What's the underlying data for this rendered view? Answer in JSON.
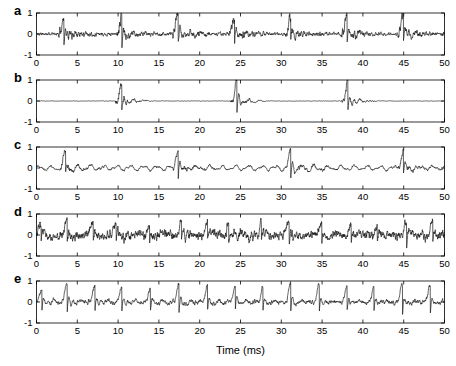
{
  "figure": {
    "background_color": "#ffffff",
    "trace_color": "#1a1a1a",
    "axis_color": "#000000",
    "xlabel": "Time (ms)",
    "panel_labels": [
      "a",
      "b",
      "c",
      "d",
      "e"
    ]
  },
  "chart_data": [
    {
      "type": "line",
      "panel": "a",
      "title": "",
      "xlabel": "",
      "ylabel": "",
      "xlim": [
        0,
        50
      ],
      "ylim": [
        -1,
        1
      ],
      "xticks": [
        0,
        5,
        10,
        15,
        20,
        25,
        30,
        35,
        40,
        45,
        50
      ],
      "xticklabels": [
        "0",
        "5",
        "10",
        "15",
        "20",
        "25",
        "30",
        "35",
        "40",
        "45",
        "50"
      ],
      "yticks": [
        -1,
        0,
        1
      ],
      "yticklabels": [
        "-1",
        "0",
        "1"
      ],
      "grid": false,
      "legend": null,
      "description": "sparse large spikes on low-amplitude noisy baseline",
      "spike_times": [
        3.2,
        10.3,
        17.2,
        24.1,
        31.0,
        37.9,
        44.8
      ],
      "spike_amplitude": 0.92,
      "noise_amplitude": 0.085,
      "baseline": 0.0,
      "seed": 11
    },
    {
      "type": "line",
      "panel": "b",
      "title": "",
      "xlabel": "",
      "ylabel": "",
      "xlim": [
        0,
        50
      ],
      "ylim": [
        -1,
        1
      ],
      "xticks": [
        0,
        5,
        10,
        15,
        20,
        25,
        30,
        35,
        40,
        45,
        50
      ],
      "xticklabels": [
        "0",
        "5",
        "10",
        "15",
        "20",
        "25",
        "30",
        "35",
        "40",
        "45",
        "50"
      ],
      "yticks": [
        -1,
        0,
        1
      ],
      "yticklabels": [
        "-1",
        "0",
        "1"
      ],
      "grid": false,
      "legend": null,
      "description": "very sparse large spikes with mostly flat baseline and short decaying ringing after each spike",
      "spike_times": [
        10.3,
        24.4,
        38.0
      ],
      "spike_amplitude": 0.98,
      "noise_amplitude": 0.022,
      "baseline": 0.0,
      "seed": 23
    },
    {
      "type": "line",
      "panel": "c",
      "title": "",
      "xlabel": "",
      "ylabel": "",
      "xlim": [
        0,
        50
      ],
      "ylim": [
        -1,
        1
      ],
      "xticks": [
        0,
        5,
        10,
        15,
        20,
        25,
        30,
        35,
        40,
        45,
        50
      ],
      "xticklabels": [
        "0",
        "5",
        "10",
        "15",
        "20",
        "25",
        "30",
        "35",
        "40",
        "45",
        "50"
      ],
      "yticks": [
        -1,
        0,
        1
      ],
      "yticklabels": [
        "-1",
        "0",
        "1"
      ],
      "grid": false,
      "legend": null,
      "description": "periodic oscillatory wave with large spikes every ~13.8 ms",
      "spike_times": [
        3.4,
        17.2,
        31.0,
        44.8
      ],
      "spike_amplitude": 0.88,
      "noise_amplitude": 0.055,
      "oscillation_amplitude": 0.09,
      "oscillation_freq_per_ms": 0.62,
      "baseline": 0.0,
      "seed": 37
    },
    {
      "type": "line",
      "panel": "d",
      "title": "",
      "xlabel": "",
      "ylabel": "",
      "xlim": [
        0,
        50
      ],
      "ylim": [
        -1,
        1
      ],
      "xticks": [
        0,
        5,
        10,
        15,
        20,
        25,
        30,
        35,
        40,
        45,
        50
      ],
      "xticklabels": [
        "0",
        "5",
        "10",
        "15",
        "20",
        "25",
        "30",
        "35",
        "40",
        "45",
        "50"
      ],
      "yticks": [
        -1,
        0,
        1
      ],
      "yticklabels": [
        "-1",
        "0",
        "1"
      ],
      "grid": false,
      "legend": null,
      "description": "dense irregular activity with many medium-amplitude fluctuations and occasional tall spikes",
      "spike_times": [
        0.4,
        3.6,
        6.8,
        9.6,
        13.7,
        17.6,
        20.8,
        23.4,
        27.4,
        30.8,
        34.8,
        38.4,
        41.6,
        45.2,
        48.4
      ],
      "spike_amplitude": 0.62,
      "noise_amplitude": 0.16,
      "baseline": 0.0,
      "seed": 53
    },
    {
      "type": "line",
      "panel": "e",
      "title": "",
      "xlabel": "",
      "ylabel": "",
      "xlim": [
        0,
        50
      ],
      "ylim": [
        -1,
        1
      ],
      "xticks": [
        0,
        5,
        10,
        15,
        20,
        25,
        30,
        35,
        40,
        45,
        50
      ],
      "xticklabels": [
        "0",
        "5",
        "10",
        "15",
        "20",
        "25",
        "30",
        "35",
        "40",
        "45",
        "50"
      ],
      "yticks": [
        -1,
        0,
        1
      ],
      "yticklabels": [
        "-1",
        "0",
        "1"
      ],
      "grid": false,
      "legend": null,
      "description": "regular bursting with spikes roughly every 3.4 ms of alternating amplitude",
      "spike_times": [
        0.5,
        3.6,
        7.0,
        10.3,
        13.8,
        17.3,
        20.8,
        24.2,
        27.6,
        31.0,
        34.5,
        37.9,
        41.2,
        44.7,
        48.1
      ],
      "spike_amplitude": 0.82,
      "noise_amplitude": 0.075,
      "baseline": 0.0,
      "seed": 71
    }
  ]
}
